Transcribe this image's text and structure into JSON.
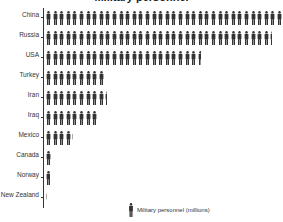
{
  "chart_data": {
    "type": "bar",
    "subtype": "pictograph",
    "title": "Military personnel",
    "categories": [
      "China",
      "Russia",
      "USA",
      "Turkey",
      "Iran",
      "Iraq",
      "Mexico",
      "Canada",
      "Norway",
      "New Zealand"
    ],
    "values": [
      3.6,
      3.44,
      2.36,
      0.9,
      0.93,
      0.8,
      0.42,
      0.1,
      0.07,
      0.015
    ],
    "icon_counts": [
      36,
      34.4,
      23.6,
      9,
      9.3,
      8,
      4.2,
      1,
      0.7,
      0.15
    ],
    "icon_unit": 0.1,
    "xlabel": "",
    "ylabel": "",
    "legend": {
      "label": "Military personnel (millions)",
      "icon": "person-icon",
      "position": "bottom"
    },
    "grid": false,
    "colors": {
      "icon": "#333333",
      "axis": "#333333",
      "text": "#333333"
    }
  }
}
